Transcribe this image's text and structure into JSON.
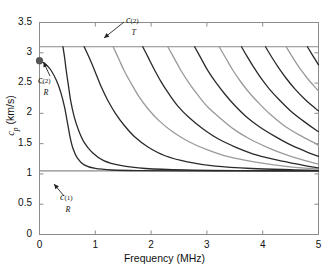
{
  "chart_data": {
    "type": "line",
    "title": "",
    "xlabel": "Frequency (MHz)",
    "ylabel": "c_p (km/s)",
    "xlim": [
      0,
      5
    ],
    "ylim": [
      0,
      3.5
    ],
    "xticks": [
      "0",
      "1",
      "2",
      "3",
      "4",
      "5"
    ],
    "xtick_values": [
      0,
      1,
      2,
      3,
      4,
      5
    ],
    "yticks": [
      "0",
      "0.5",
      "1",
      "1.5",
      "2",
      "2.5",
      "3",
      "3.5"
    ],
    "ytick_values": [
      0,
      0.5,
      1,
      1.5,
      2,
      2.5,
      3,
      3.5
    ],
    "grid": false,
    "legend": "none",
    "annotations": [
      {
        "name": "c_T^(2)",
        "base": "c",
        "sup": "(2)",
        "sub": "T",
        "value": 3.1,
        "points_to_x": 1.05,
        "points_to_y": 3.1
      },
      {
        "name": "c_R^(2)",
        "base": "c",
        "sup": "(2)",
        "sub": "R",
        "value": 2.87,
        "points_to_x": 0.0,
        "points_to_y": 2.87
      },
      {
        "name": "c_R^(1)",
        "base": "c",
        "sup": "(1)",
        "sub": "R",
        "value": 1.05,
        "points_to_x": 0.35,
        "points_to_y": 1.05
      }
    ],
    "reference_lines": [
      {
        "name": "c_T^(2)",
        "y": 3.1,
        "color": "#8a8a8a",
        "style": "solid"
      },
      {
        "name": "c_R^(1)",
        "y": 1.05,
        "color": "#8a8a8a",
        "style": "solid"
      }
    ],
    "marker_points": [
      {
        "name": "c_R^(2)-start",
        "x": 0.0,
        "y": 2.87,
        "color": "#555555"
      }
    ],
    "series": [
      {
        "name": "mode-0",
        "color": "#2a2a2a",
        "points": [
          [
            0.0,
            2.87
          ],
          [
            0.1,
            2.82
          ],
          [
            0.2,
            2.72
          ],
          [
            0.3,
            2.55
          ],
          [
            0.38,
            2.35
          ],
          [
            0.45,
            2.1
          ],
          [
            0.5,
            1.85
          ],
          [
            0.55,
            1.6
          ],
          [
            0.6,
            1.42
          ],
          [
            0.68,
            1.26
          ],
          [
            0.8,
            1.15
          ],
          [
            1.0,
            1.09
          ],
          [
            1.3,
            1.065
          ],
          [
            1.8,
            1.055
          ],
          [
            2.5,
            1.05
          ],
          [
            3.5,
            1.05
          ],
          [
            5.0,
            1.05
          ]
        ]
      },
      {
        "name": "mode-1",
        "color": "#2a2a2a",
        "points": [
          [
            0.42,
            3.1
          ],
          [
            0.45,
            2.92
          ],
          [
            0.48,
            2.7
          ],
          [
            0.52,
            2.45
          ],
          [
            0.56,
            2.2
          ],
          [
            0.62,
            1.95
          ],
          [
            0.7,
            1.72
          ],
          [
            0.8,
            1.52
          ],
          [
            0.95,
            1.35
          ],
          [
            1.15,
            1.22
          ],
          [
            1.45,
            1.14
          ],
          [
            1.9,
            1.09
          ],
          [
            2.6,
            1.065
          ],
          [
            3.6,
            1.055
          ],
          [
            5.0,
            1.05
          ]
        ]
      },
      {
        "name": "mode-2",
        "color": "#2a2a2a",
        "points": [
          [
            0.8,
            3.1
          ],
          [
            0.9,
            2.9
          ],
          [
            1.0,
            2.68
          ],
          [
            1.1,
            2.45
          ],
          [
            1.22,
            2.22
          ],
          [
            1.36,
            2.0
          ],
          [
            1.52,
            1.8
          ],
          [
            1.72,
            1.6
          ],
          [
            1.95,
            1.44
          ],
          [
            2.25,
            1.3
          ],
          [
            2.65,
            1.2
          ],
          [
            3.15,
            1.13
          ],
          [
            3.8,
            1.09
          ],
          [
            4.5,
            1.07
          ],
          [
            5.0,
            1.06
          ]
        ]
      },
      {
        "name": "mode-3",
        "color": "#9a9a9a",
        "points": [
          [
            1.32,
            3.1
          ],
          [
            1.42,
            2.9
          ],
          [
            1.52,
            2.7
          ],
          [
            1.64,
            2.5
          ],
          [
            1.78,
            2.28
          ],
          [
            1.94,
            2.08
          ],
          [
            2.14,
            1.88
          ],
          [
            2.38,
            1.7
          ],
          [
            2.66,
            1.54
          ],
          [
            3.0,
            1.4
          ],
          [
            3.4,
            1.28
          ],
          [
            3.9,
            1.19
          ],
          [
            4.45,
            1.12
          ],
          [
            5.0,
            1.08
          ]
        ]
      },
      {
        "name": "mode-4",
        "color": "#2a2a2a",
        "points": [
          [
            1.85,
            3.1
          ],
          [
            1.95,
            2.92
          ],
          [
            2.06,
            2.72
          ],
          [
            2.18,
            2.52
          ],
          [
            2.32,
            2.32
          ],
          [
            2.48,
            2.12
          ],
          [
            2.68,
            1.93
          ],
          [
            2.92,
            1.75
          ],
          [
            3.2,
            1.58
          ],
          [
            3.52,
            1.44
          ],
          [
            3.9,
            1.31
          ],
          [
            4.35,
            1.21
          ],
          [
            4.8,
            1.13
          ],
          [
            5.0,
            1.1
          ]
        ]
      },
      {
        "name": "mode-5",
        "color": "#9a9a9a",
        "points": [
          [
            2.3,
            3.1
          ],
          [
            2.42,
            2.9
          ],
          [
            2.54,
            2.7
          ],
          [
            2.68,
            2.5
          ],
          [
            2.84,
            2.3
          ],
          [
            3.02,
            2.1
          ],
          [
            3.24,
            1.92
          ],
          [
            3.48,
            1.74
          ],
          [
            3.76,
            1.58
          ],
          [
            4.08,
            1.44
          ],
          [
            4.44,
            1.31
          ],
          [
            4.8,
            1.21
          ],
          [
            5.0,
            1.16
          ]
        ]
      },
      {
        "name": "mode-6",
        "color": "#2a2a2a",
        "points": [
          [
            2.78,
            3.1
          ],
          [
            2.9,
            2.9
          ],
          [
            3.02,
            2.7
          ],
          [
            3.16,
            2.51
          ],
          [
            3.32,
            2.32
          ],
          [
            3.5,
            2.13
          ],
          [
            3.7,
            1.95
          ],
          [
            3.94,
            1.78
          ],
          [
            4.22,
            1.62
          ],
          [
            4.52,
            1.47
          ],
          [
            4.85,
            1.34
          ],
          [
            5.0,
            1.29
          ]
        ]
      },
      {
        "name": "mode-7",
        "color": "#9a9a9a",
        "points": [
          [
            3.22,
            3.1
          ],
          [
            3.34,
            2.91
          ],
          [
            3.46,
            2.72
          ],
          [
            3.6,
            2.53
          ],
          [
            3.76,
            2.34
          ],
          [
            3.94,
            2.16
          ],
          [
            4.14,
            1.98
          ],
          [
            4.38,
            1.8
          ],
          [
            4.66,
            1.64
          ],
          [
            4.95,
            1.5
          ],
          [
            5.0,
            1.47
          ]
        ]
      },
      {
        "name": "mode-8",
        "color": "#2a2a2a",
        "points": [
          [
            3.62,
            3.1
          ],
          [
            3.72,
            2.94
          ],
          [
            3.84,
            2.76
          ],
          [
            3.97,
            2.58
          ],
          [
            4.12,
            2.4
          ],
          [
            4.3,
            2.22
          ],
          [
            4.5,
            2.04
          ],
          [
            4.72,
            1.88
          ],
          [
            4.96,
            1.72
          ],
          [
            5.0,
            1.7
          ]
        ]
      },
      {
        "name": "mode-9",
        "color": "#2a2a2a",
        "points": [
          [
            4.05,
            3.1
          ],
          [
            4.16,
            2.93
          ],
          [
            4.28,
            2.76
          ],
          [
            4.42,
            2.58
          ],
          [
            4.58,
            2.4
          ],
          [
            4.76,
            2.23
          ],
          [
            4.96,
            2.07
          ],
          [
            5.0,
            2.04
          ]
        ]
      },
      {
        "name": "mode-10",
        "color": "#9a9a9a",
        "points": [
          [
            4.42,
            3.1
          ],
          [
            4.54,
            2.92
          ],
          [
            4.66,
            2.75
          ],
          [
            4.8,
            2.58
          ],
          [
            4.95,
            2.42
          ],
          [
            5.0,
            2.37
          ]
        ]
      },
      {
        "name": "mode-11",
        "color": "#2a2a2a",
        "points": [
          [
            4.8,
            3.1
          ],
          [
            4.9,
            2.95
          ],
          [
            5.0,
            2.8
          ]
        ]
      }
    ]
  },
  "axis": {
    "x_title": "Frequency (MHz)",
    "y_title_base": "c",
    "y_title_sub": "p",
    "y_title_unit": "(km/s)"
  }
}
